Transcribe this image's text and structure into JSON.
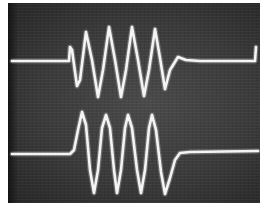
{
  "image": {
    "description": "Oscilloscope photograph showing two sinusoidal burst waveforms",
    "background_color": "#3a3a3a",
    "trace_color": "#f4f4f4",
    "screen": {
      "x": 8,
      "y": 3,
      "width": 252,
      "height": 200
    }
  },
  "traces": [
    {
      "name": "upper-burst",
      "baseline_y": 61,
      "cycles": 4,
      "points": "12,61 69,61 70,47 72,50 77,86 80,80 86,32 92,60 98,97 103,70 109,27 115,60 121,97 126,70 132,27 138,60 144,96 149,70 155,29 160,58 165,89 170,70 178,57 186,60 200,61 255,61 256,47"
    },
    {
      "name": "lower-burst",
      "baseline_y": 154,
      "cycles": 4,
      "points": "12,154 70,154 74,150 78,130 82,112 86,125 90,170 94,193 98,170 102,128 106,115 110,128 114,170 117,193 121,170 125,128 128,115 132,128 137,170 141,193 145,170 149,128 152,115 156,130 161,172 165,194 170,178 175,160 180,153 190,152 258,151"
    }
  ]
}
